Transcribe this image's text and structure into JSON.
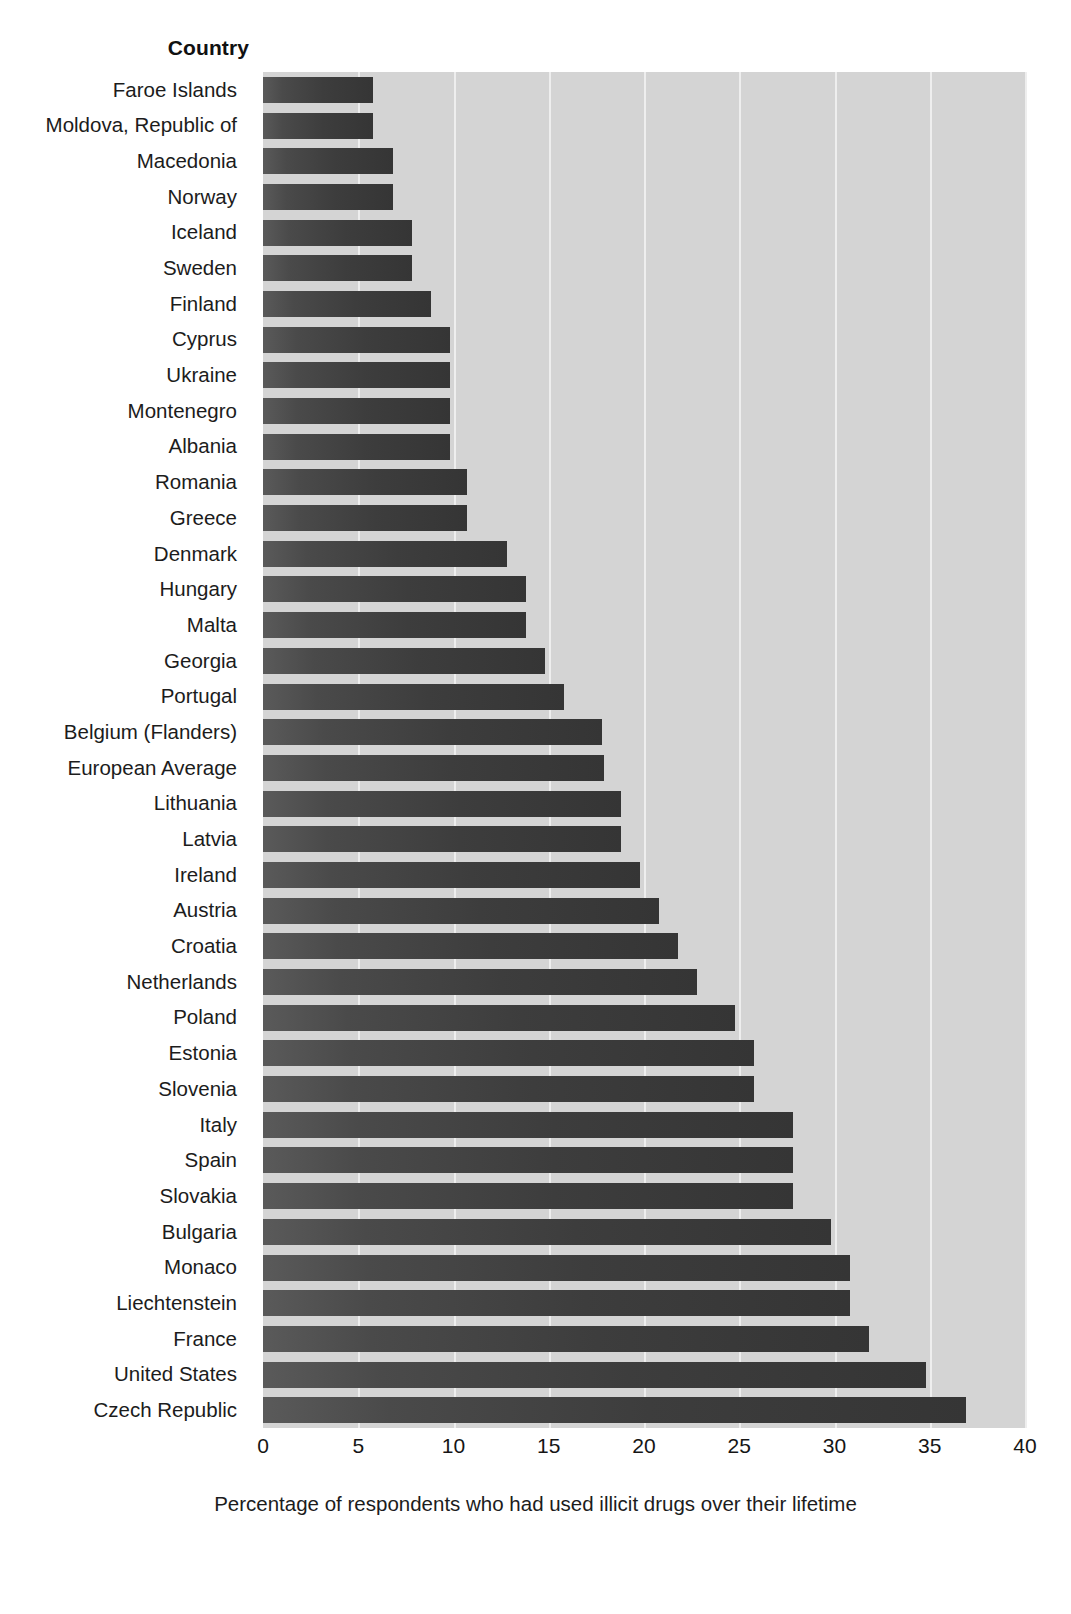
{
  "chart_data": {
    "type": "bar",
    "orientation": "horizontal",
    "title": "",
    "xlabel": "Percentage of respondents who had used illicit drugs over their lifetime",
    "ylabel": "Country",
    "xlim": [
      0,
      40
    ],
    "xticks": [
      0,
      5,
      10,
      15,
      20,
      25,
      30,
      35,
      40
    ],
    "xtick_labels": [
      "0",
      "5",
      "10",
      "15",
      "20",
      "25",
      "30",
      "35",
      "40"
    ],
    "grid": "vertical",
    "legend": "none",
    "bar_color": "#3d3d3d",
    "plot_background": "#d4d4d4",
    "categories": [
      "Faroe Islands",
      "Moldova, Republic of",
      "Macedonia",
      "Norway",
      "Iceland",
      "Sweden",
      "Finland",
      "Cyprus",
      "Ukraine",
      "Montenegro",
      "Albania",
      "Romania",
      "Greece",
      "Denmark",
      "Hungary",
      "Malta",
      "Georgia",
      "Portugal",
      "Belgium (Flanders)",
      "European Average",
      "Lithuania",
      "Latvia",
      "Ireland",
      "Austria",
      "Croatia",
      "Netherlands",
      "Poland",
      "Estonia",
      "Slovenia",
      "Italy",
      "Spain",
      "Slovakia",
      "Bulgaria",
      "Monaco",
      "Liechtenstein",
      "France",
      "United States",
      "Czech Republic"
    ],
    "values": [
      5.8,
      5.8,
      6.8,
      6.8,
      7.8,
      7.8,
      8.8,
      9.8,
      9.8,
      9.8,
      9.8,
      10.7,
      10.7,
      12.8,
      13.8,
      13.8,
      14.8,
      15.8,
      17.8,
      17.9,
      18.8,
      18.8,
      19.8,
      20.8,
      21.8,
      22.8,
      24.8,
      25.8,
      25.8,
      27.8,
      27.8,
      27.8,
      29.8,
      30.8,
      30.8,
      31.8,
      34.8,
      36.9
    ]
  }
}
